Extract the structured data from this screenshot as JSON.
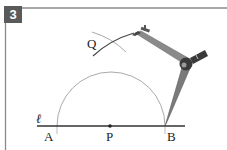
{
  "figure": {
    "step_number": "3",
    "labels": {
      "line": "ℓ",
      "point_a": "A",
      "point_p": "P",
      "point_b": "B",
      "point_q": "Q"
    },
    "colors": {
      "badge_bg": "#5a5a5a",
      "frame": "#8a8a8a",
      "line": "#333333",
      "arc": "#aaaaaa",
      "compass": "#777777",
      "compass_dark": "#3a3a3a"
    }
  }
}
